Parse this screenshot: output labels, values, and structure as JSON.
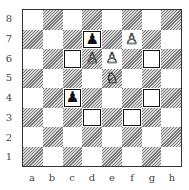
{
  "ranks": [
    "8",
    "7",
    "6",
    "5",
    "4",
    "3",
    "2",
    "1"
  ],
  "files": [
    "a",
    "b",
    "c",
    "d",
    "e",
    "f",
    "g",
    "h"
  ],
  "pieces": [
    {
      "square": "d7",
      "glyph": "♟",
      "color": "b",
      "name": "black-pawn"
    },
    {
      "square": "f7",
      "glyph": "♙",
      "color": "w",
      "name": "white-pawn"
    },
    {
      "square": "d6",
      "glyph": "♙",
      "color": "w",
      "name": "white-pawn"
    },
    {
      "square": "e6",
      "glyph": "♙",
      "color": "w",
      "name": "white-pawn"
    },
    {
      "square": "e5",
      "glyph": "♘",
      "color": "w",
      "name": "white-knight"
    },
    {
      "square": "c4",
      "glyph": "♟",
      "color": "b",
      "name": "black-pawn"
    }
  ],
  "marked_squares": [
    "d7",
    "c6",
    "g6",
    "c4",
    "g4",
    "d3",
    "f3"
  ]
}
